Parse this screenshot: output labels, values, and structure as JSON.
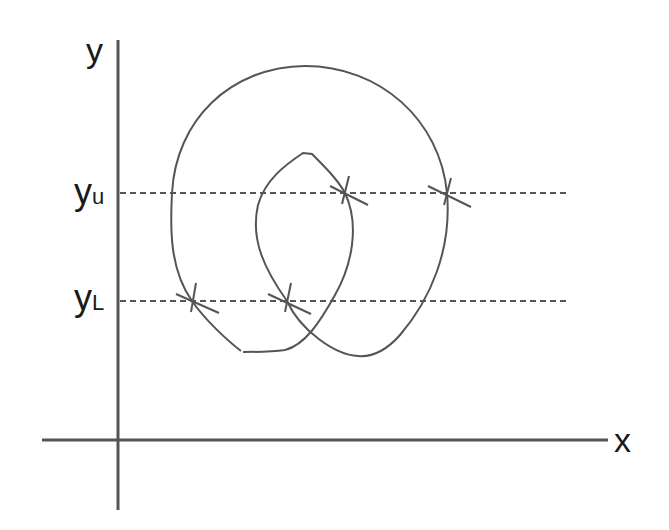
{
  "diagram": {
    "type": "level-crossing sketch",
    "axes": {
      "x_label": "x",
      "y_label": "y"
    },
    "levels": [
      {
        "id": "upper",
        "label_main": "y",
        "label_sub": "u",
        "y_px": 193
      },
      {
        "id": "lower",
        "label_main": "y",
        "label_sub": "L",
        "y_px": 301
      }
    ],
    "crossing_marks": [
      {
        "level": "upper",
        "x_px": 345
      },
      {
        "level": "upper",
        "x_px": 447
      },
      {
        "level": "lower",
        "x_px": 192
      },
      {
        "level": "lower",
        "x_px": 287
      }
    ],
    "colors": {
      "axis": "#555555",
      "curve": "#555555",
      "dashed": "#555555",
      "text": "#1a1a1a",
      "background": "#ffffff"
    }
  }
}
